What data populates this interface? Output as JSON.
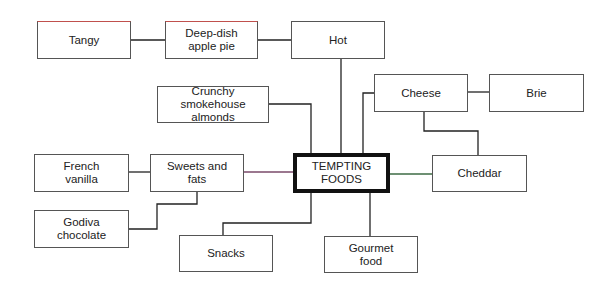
{
  "diagram": {
    "title": "TEMPTING FOODS",
    "nodes": {
      "center": {
        "label": "TEMPTING\nFOODS"
      },
      "tangy": {
        "label": "Tangy"
      },
      "apple_pie": {
        "label": "Deep-dish\napple pie"
      },
      "hot": {
        "label": "Hot"
      },
      "cheese": {
        "label": "Cheese"
      },
      "brie": {
        "label": "Brie"
      },
      "almonds": {
        "label": "Crunchy\nsmokehouse almonds"
      },
      "french_vanilla": {
        "label": "French\nvanilla"
      },
      "sweets": {
        "label": "Sweets and\nfats"
      },
      "cheddar": {
        "label": "Cheddar"
      },
      "godiva": {
        "label": "Godiva\nchocolate"
      },
      "snacks": {
        "label": "Snacks"
      },
      "gourmet": {
        "label": "Gourmet\nfood"
      }
    },
    "edges": [
      [
        "tangy",
        "apple_pie"
      ],
      [
        "apple_pie",
        "hot"
      ],
      [
        "hot",
        "center"
      ],
      [
        "cheese",
        "brie"
      ],
      [
        "cheese",
        "center"
      ],
      [
        "cheese",
        "cheddar"
      ],
      [
        "almonds",
        "center"
      ],
      [
        "french_vanilla",
        "sweets"
      ],
      [
        "sweets",
        "center"
      ],
      [
        "sweets",
        "godiva"
      ],
      [
        "center",
        "cheddar"
      ],
      [
        "center",
        "snacks"
      ],
      [
        "center",
        "gourmet"
      ]
    ]
  }
}
